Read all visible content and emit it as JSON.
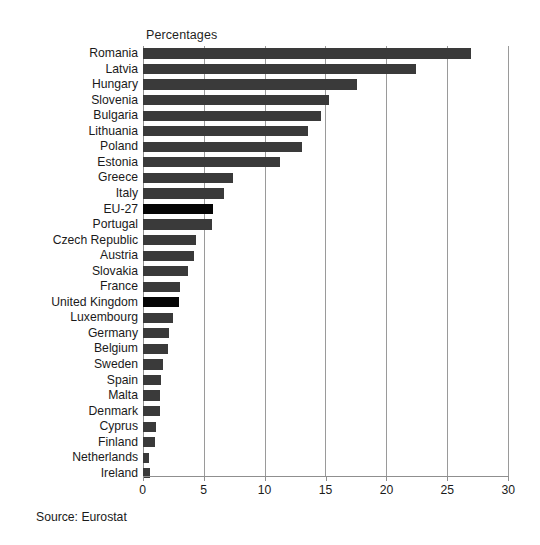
{
  "chart_data": {
    "type": "bar",
    "orientation": "horizontal",
    "title": "Percentages",
    "xlabel": "",
    "ylabel": "",
    "xlim": [
      0,
      30
    ],
    "xticks": [
      0,
      5,
      10,
      15,
      20,
      25,
      30
    ],
    "grid": true,
    "legend": null,
    "source": "Source: Eurostat",
    "bar_color": "#3a3a3a",
    "highlight_color": "#050505",
    "highlighted_categories": [
      "EU-27",
      "United Kingdom"
    ],
    "categories": [
      "Romania",
      "Latvia",
      "Hungary",
      "Slovenia",
      "Bulgaria",
      "Lithuania",
      "Poland",
      "Estonia",
      "Greece",
      "Italy",
      "EU-27",
      "Portugal",
      "Czech Republic",
      "Austria",
      "Slovakia",
      "France",
      "United Kingdom",
      "Luxembourg",
      "Germany",
      "Belgium",
      "Sweden",
      "Spain",
      "Malta",
      "Denmark",
      "Cyprus",
      "Finland",
      "Netherlands",
      "Ireland"
    ],
    "values": [
      26.9,
      22.4,
      17.6,
      15.3,
      14.6,
      13.6,
      13.1,
      11.3,
      7.4,
      6.7,
      5.8,
      5.7,
      4.4,
      4.2,
      3.7,
      3.1,
      3.0,
      2.5,
      2.2,
      2.1,
      1.7,
      1.5,
      1.4,
      1.4,
      1.1,
      1.0,
      0.5,
      0.6
    ]
  }
}
